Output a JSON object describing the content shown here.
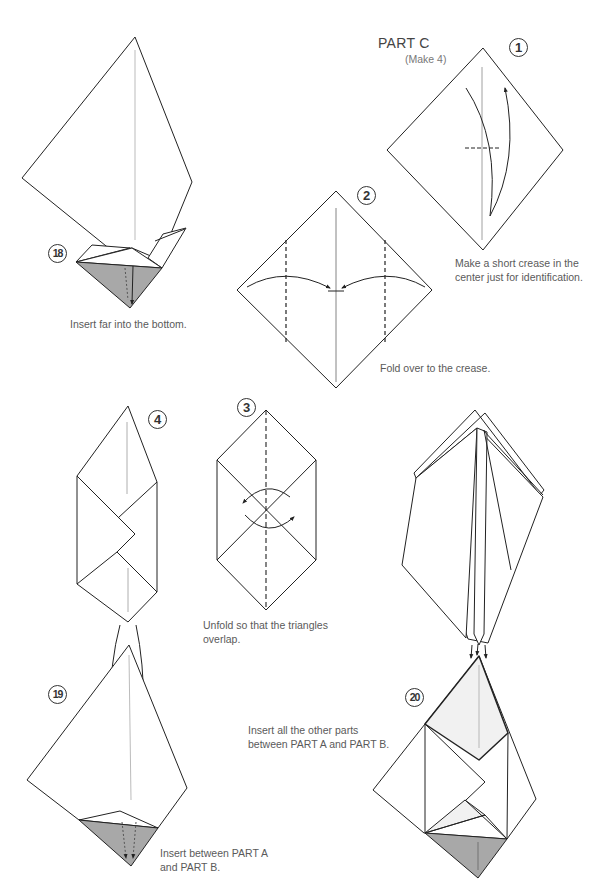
{
  "page": {
    "heading": "PART C",
    "subheading": "(Make 4)",
    "colors": {
      "paper": "#ffffff",
      "shade": "#a8a8a8",
      "light_shade": "#f1f1f1",
      "line": "#222222"
    }
  },
  "steps": [
    {
      "number": "18",
      "caption": "Insert far into the bottom."
    },
    {
      "number": "1",
      "caption_lines": [
        "Make a short crease in the",
        "center just for identification."
      ]
    },
    {
      "number": "2",
      "caption": "Fold over to the crease."
    },
    {
      "number": "3",
      "caption_lines": [
        "Unfold so that the triangles",
        "overlap."
      ]
    },
    {
      "number": "4",
      "caption": ""
    },
    {
      "number": "19",
      "caption_lines": [
        "Insert between PART A",
        "and PART B."
      ]
    },
    {
      "number": "20",
      "caption_lines": [
        "Insert all the other parts",
        "between PART A and PART B."
      ]
    }
  ]
}
